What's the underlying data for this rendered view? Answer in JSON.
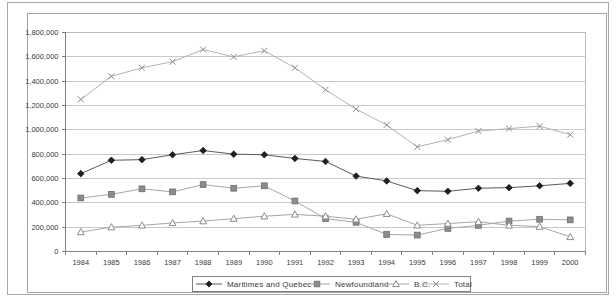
{
  "window": {
    "background": "#ffffff",
    "outer_border_color": "#a9a9a9",
    "chart_border_color": "#a3a3a3"
  },
  "styles": {
    "plot_background": "#ffffff",
    "grid_color": "#c9c9c9",
    "plot_border_color": "#bdbdbd",
    "axis_color": "#7f7f7f",
    "text_color": "#3a3a3a"
  },
  "chart_data": {
    "type": "line",
    "x_categories": [
      "1984",
      "1985",
      "1986",
      "1987",
      "1988",
      "1989",
      "1990",
      "1991",
      "1992",
      "1993",
      "1994",
      "1995",
      "1996",
      "1997",
      "1998",
      "1999",
      "2000"
    ],
    "y_axis": {
      "min": 0,
      "max": 1800000,
      "step": 200000,
      "tick_labels": [
        "0",
        "200,000",
        "400,000",
        "600,000",
        "800,000",
        "1,000,000",
        "1,200,000",
        "1,400,000",
        "1,600,000",
        "1,800,000"
      ]
    },
    "grid": "horizontal",
    "legend_position": "bottom",
    "series": [
      {
        "name": "Maritimes and Quebec",
        "marker": "diamond",
        "line_color": "#5a5a5a",
        "marker_fill": "#1f1f1f",
        "marker_stroke": "#1f1f1f",
        "values": [
          640000,
          750000,
          755000,
          795000,
          830000,
          800000,
          795000,
          765000,
          740000,
          620000,
          580000,
          500000,
          495000,
          520000,
          525000,
          540000,
          560000
        ]
      },
      {
        "name": "Newfoundland",
        "marker": "square",
        "line_color": "#a6a6a6",
        "marker_fill": "#8c8c8c",
        "marker_stroke": "#6e6e6e",
        "values": [
          440000,
          470000,
          515000,
          490000,
          550000,
          520000,
          540000,
          415000,
          270000,
          240000,
          140000,
          135000,
          190000,
          215000,
          250000,
          265000,
          260000
        ]
      },
      {
        "name": "B.C.",
        "marker": "triangle",
        "line_color": "#a6a6a6",
        "marker_fill": "#ffffff",
        "marker_stroke": "#8c8c8c",
        "values": [
          160000,
          200000,
          215000,
          235000,
          250000,
          270000,
          290000,
          305000,
          290000,
          265000,
          310000,
          215000,
          230000,
          245000,
          215000,
          205000,
          120000
        ]
      },
      {
        "name": "Total",
        "marker": "x",
        "line_color": "#b3b3b3",
        "marker_fill": "none",
        "marker_stroke": "#8c8c8c",
        "values": [
          1250000,
          1440000,
          1510000,
          1560000,
          1660000,
          1600000,
          1650000,
          1510000,
          1330000,
          1170000,
          1040000,
          860000,
          920000,
          990000,
          1010000,
          1030000,
          960000
        ]
      }
    ]
  }
}
